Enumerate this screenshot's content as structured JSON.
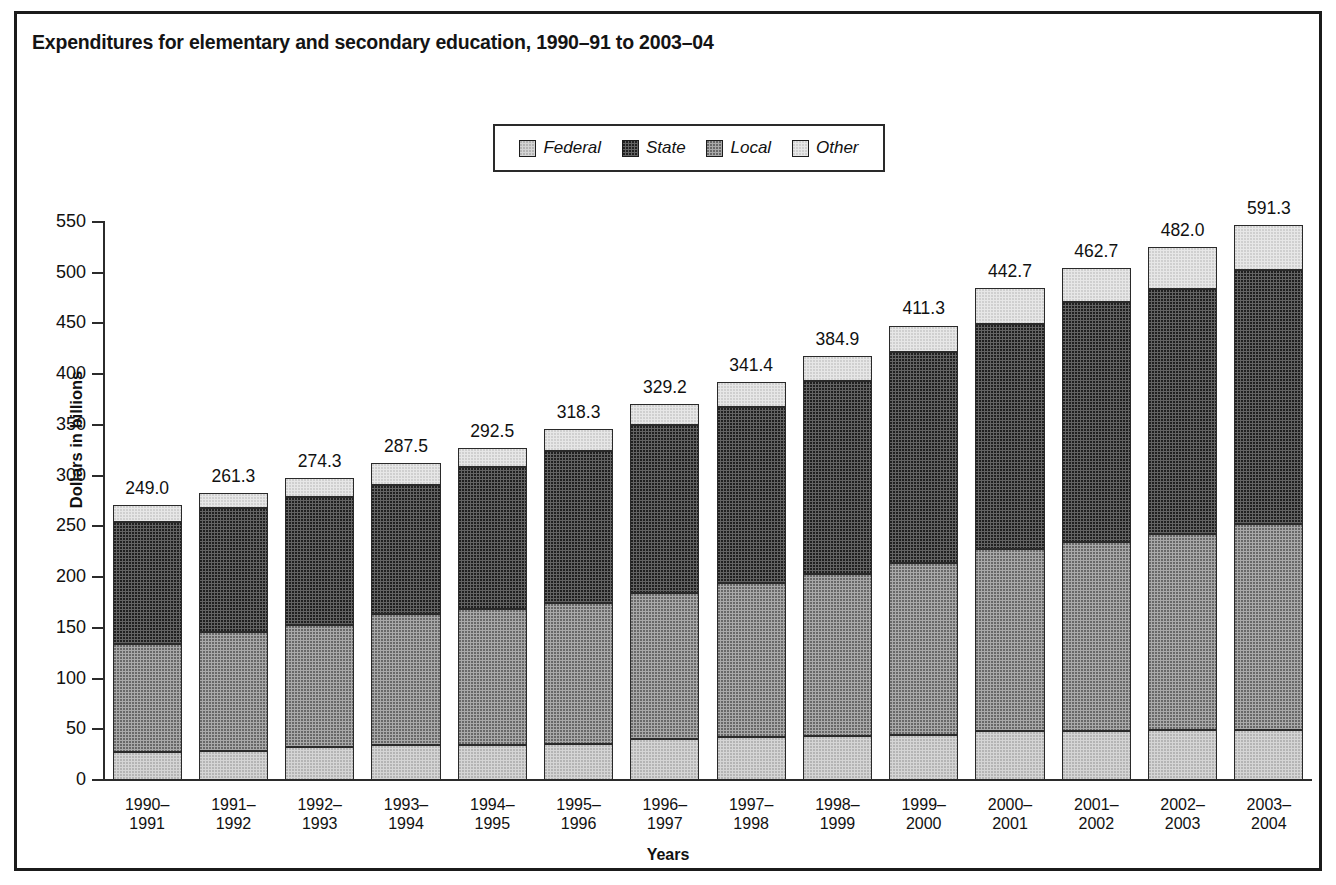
{
  "figure": {
    "title": "Expenditures for elementary and secondary education, 1990–91 to 2003–04"
  },
  "legend": {
    "position": "top-center",
    "items": [
      {
        "label": "Federal",
        "swatch": "federal-swatch",
        "color": "#d5d5d5"
      },
      {
        "label": "State",
        "swatch": "state-swatch",
        "color": "#636363"
      },
      {
        "label": "Local",
        "swatch": "local-swatch",
        "color": "#a9a9a9"
      },
      {
        "label": "Other",
        "swatch": "other-swatch",
        "color": "#e7e7e7"
      }
    ]
  },
  "axes": {
    "x_title": "Years",
    "y_title": "Dollars in billions",
    "y_ticks": [
      "0",
      "50",
      "100",
      "150",
      "200",
      "250",
      "300",
      "350",
      "400",
      "450",
      "500",
      "550"
    ]
  },
  "chart_data": {
    "type": "bar",
    "subtype": "stacked-vertical",
    "title": "Expenditures for elementary and secondary education, 1990–91 to 2003–04",
    "xlabel": "Years",
    "ylabel": "Dollars in billions",
    "ylim": [
      0,
      550
    ],
    "ytick_step": 50,
    "grid": false,
    "legend_position": "top-center",
    "stack_order_bottom_to_top": [
      "Federal",
      "Local",
      "State",
      "Other"
    ],
    "categories": [
      "1990–\n1991",
      "1991–\n1992",
      "1992–\n1993",
      "1993–\n1994",
      "1994–\n1995",
      "1995–\n1996",
      "1996–\n1997",
      "1997–\n1998",
      "1998–\n1999",
      "1999–\n2000",
      "2000–\n2001",
      "2001–\n2002",
      "2002–\n2003",
      "2003–\n2004"
    ],
    "category_lines": [
      [
        "1990–",
        "1991"
      ],
      [
        "1991–",
        "1992"
      ],
      [
        "1992–",
        "1993"
      ],
      [
        "1993–",
        "1994"
      ],
      [
        "1994–",
        "1995"
      ],
      [
        "1995–",
        "1996"
      ],
      [
        "1996–",
        "1997"
      ],
      [
        "1997–",
        "1998"
      ],
      [
        "1998–",
        "1999"
      ],
      [
        "1999–",
        "2000"
      ],
      [
        "2000–",
        "2001"
      ],
      [
        "2001–",
        "2002"
      ],
      [
        "2002–",
        "2003"
      ],
      [
        "2003–",
        "2004"
      ]
    ],
    "series": [
      {
        "name": "Federal",
        "color": "#d5d5d5",
        "values": [
          28.0,
          29.0,
          33.0,
          34.5,
          35.0,
          35.5,
          40.5,
          42.0,
          43.5,
          44.5,
          48.0,
          48.5,
          49.0,
          49.5
        ]
      },
      {
        "name": "Local",
        "color": "#a9a9a9",
        "values": [
          106.5,
          117.0,
          120.0,
          129.0,
          133.5,
          139.0,
          143.5,
          152.5,
          159.5,
          169.0,
          180.0,
          186.5,
          193.5,
          202.5
        ]
      },
      {
        "name": "State",
        "color": "#636363",
        "values": [
          120.0,
          122.0,
          126.0,
          127.0,
          140.5,
          150.0,
          165.5,
          173.5,
          190.0,
          208.0,
          221.0,
          236.5,
          241.0,
          251.0
        ]
      },
      {
        "name": "Other",
        "color": "#e7e7e7",
        "values": [
          16.5,
          15.0,
          18.5,
          22.0,
          18.5,
          21.5,
          21.5,
          24.0,
          24.5,
          26.5,
          35.5,
          33.5,
          41.5,
          44.5
        ]
      }
    ],
    "bar_total_labels": [
      "249.0",
      "261.3",
      "274.3",
      "287.5",
      "292.5",
      "318.3",
      "329.2",
      "341.4",
      "384.9",
      "411.3",
      "442.7",
      "462.7",
      "482.0",
      "591.3"
    ],
    "bar_stack_tops": [
      271.0,
      283.0,
      297.5,
      312.5,
      327.5,
      346.0,
      371.0,
      392.0,
      417.5,
      448.0,
      484.5,
      505.0,
      525.0,
      547.5
    ]
  }
}
